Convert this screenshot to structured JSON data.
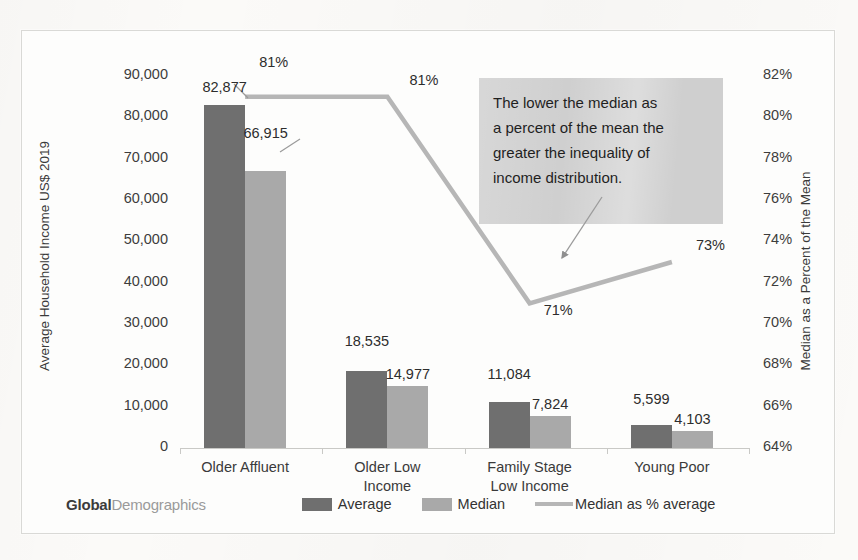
{
  "chart_data": {
    "type": "bar",
    "title": "",
    "subtitle": "",
    "categories": [
      "Older Affluent",
      "Older Low Income",
      "Family Stage Low Income",
      "Young Poor"
    ],
    "series": [
      {
        "name": "Average",
        "axis": "left",
        "values": [
          82877,
          18535,
          11084,
          5599
        ],
        "labels": [
          "82,877",
          "18,535",
          "11,084",
          "5,599"
        ],
        "color": "#6f6f6f",
        "kind": "bar"
      },
      {
        "name": "Median",
        "axis": "left",
        "values": [
          66915,
          14977,
          7824,
          4103
        ],
        "labels": [
          "66,915",
          "14,977",
          "7,824",
          "4,103"
        ],
        "color": "#a9a9a9",
        "kind": "bar"
      },
      {
        "name": "Median as % average",
        "axis": "right",
        "values": [
          81,
          81,
          71,
          73
        ],
        "labels": [
          "81%",
          "81%",
          "71%",
          "73%"
        ],
        "color": "#b6b6b6",
        "kind": "line"
      }
    ],
    "xlabel": "",
    "ylabel": "Average Household Income US$ 2019",
    "y2label": "Median as a Percent of the Mean",
    "ylim": [
      0,
      90000
    ],
    "y2lim": [
      64,
      82
    ],
    "yticks": [
      "0",
      "10,000",
      "20,000",
      "30,000",
      "40,000",
      "50,000",
      "60,000",
      "70,000",
      "80,000",
      "90,000"
    ],
    "y2ticks": [
      "64%",
      "66%",
      "68%",
      "70%",
      "72%",
      "74%",
      "76%",
      "78%",
      "80%",
      "82%"
    ],
    "grid": false,
    "legend_position": "bottom",
    "annotation": "The lower the median as a percent of the mean the greater the inequality of income distribution."
  },
  "axes": {
    "left_title": "Average Household Income US$ 2019",
    "right_title": "Median as a Percent of the Mean"
  },
  "legend": {
    "logo_bold": "Global",
    "logo_light": "Demographics",
    "items": [
      {
        "label": "Average",
        "type": "swatch-dark"
      },
      {
        "label": "Median",
        "type": "swatch-light"
      },
      {
        "label": "Median as % average",
        "type": "line"
      }
    ]
  },
  "annotation": {
    "line1": "The lower the median as",
    "line2": "a percent of the mean the",
    "line3": "greater the inequality of",
    "line4": "income distribution."
  },
  "colors": {
    "average_bar": "#6f6f6f",
    "median_bar": "#a9a9a9",
    "line": "#b6b6b6",
    "annotation_bg": "#cfcfcf",
    "frame": "#d9d9d6",
    "page": "#fbfaf8"
  }
}
